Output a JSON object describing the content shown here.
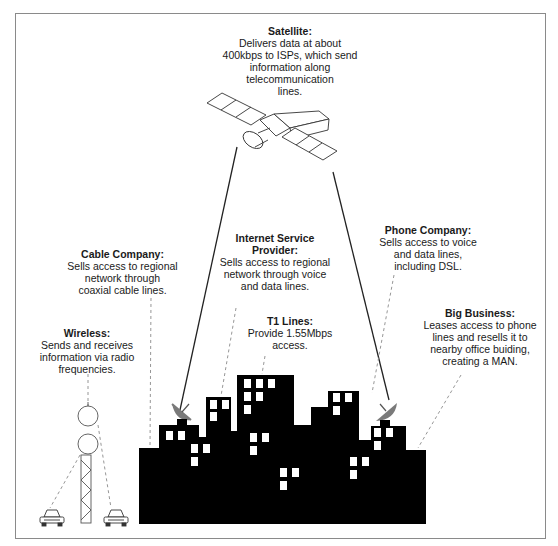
{
  "diagram": {
    "colors": {
      "buildings": "#000000",
      "windows": "#ffffff",
      "dish": "#7a7a7a",
      "lines": "#222222",
      "dashed": "#8a8a8a",
      "frame": "#8a8a8a"
    },
    "labels": {
      "satellite": {
        "title": "Satellite:",
        "desc": "Delivers data at about\n400kbps to ISPs, which send\ninformation along\ntelecommunication\nlines."
      },
      "cable_company": {
        "title": "Cable Company:",
        "desc": "Sells access to regional\nnetwork through\ncoaxial cable lines."
      },
      "isp": {
        "title": "Internet Service\nProvider:",
        "desc": "Sells access to regional\nnetwork through voice\nand data lines."
      },
      "phone_company": {
        "title": "Phone Company:",
        "desc": "Sells access to voice\nand data lines,\nincluding DSL."
      },
      "t1_lines": {
        "title": "T1 Lines:",
        "desc": "Provide 1.55Mbps\naccess."
      },
      "big_business": {
        "title": "Big Business:",
        "desc": "Leases access to phone\nlines and resells it to\nnearby office buiding,\ncreating a MAN."
      },
      "wireless": {
        "title": "Wireless:",
        "desc": "Sends and receives\ninformation via radio\nfrequencies."
      }
    },
    "icons": [
      "satellite-icon",
      "satellite-dish-icon",
      "radio-tower-icon",
      "car-icon",
      "city-buildings-icon"
    ]
  }
}
